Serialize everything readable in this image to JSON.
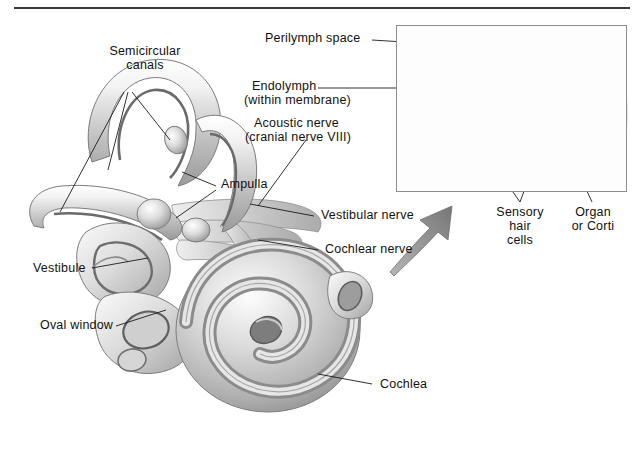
{
  "figure": {
    "background_color": "#ffffff",
    "rule_color": "#3a3a3a",
    "ink_color": "#111111",
    "leader_color": "#1a1a1a",
    "arrow_color": "#8c8c8c",
    "inset_border_color": "#8d8d8d"
  },
  "labels": {
    "semicircular_canals": "Semicircular\ncanals",
    "perilymph_space": "Perilymph space",
    "endolymph": "Endolymph",
    "endolymph_sub": "(within membrane)",
    "acoustic_nerve": "Acoustic nerve",
    "acoustic_nerve_sub": "(cranial nerve VIII)",
    "ampulla": "Ampulla",
    "vestibular_nerve": "Vestibular nerve",
    "cochlear_nerve": "Cochlear nerve",
    "vestibule": "Vestibule",
    "oval_window": "Oval window",
    "cochlea": "Cochlea",
    "sensory_hair_cells": "Sensory\nhair\ncells",
    "organ_or_corti": "Organ\nor Corti"
  },
  "inset": {
    "x": 396,
    "y": 25,
    "width": 231,
    "height": 167,
    "contents": "cross-section of the cochlear duct showing tectorial membrane, hair cells and organ of Corti"
  }
}
